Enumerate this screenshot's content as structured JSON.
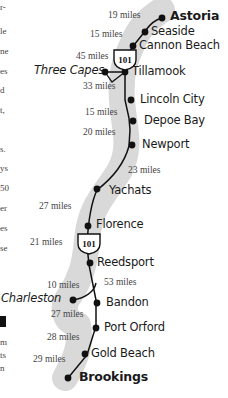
{
  "left_column_fragments": [
    "r-",
    "le",
    "ne",
    "es",
    "d",
    "t,",
    "",
    "s.",
    "ys",
    "50",
    "er",
    "es",
    "se",
    "",
    "",
    "m",
    "ts",
    "n"
  ],
  "route": {
    "highway": "101",
    "colors": {
      "corridor": "#d9d9d9",
      "line": "#111111",
      "dot": "#111111"
    },
    "stops": [
      {
        "name": "Astoria",
        "style": "bold"
      },
      {
        "name": "Seaside",
        "style": "normal"
      },
      {
        "name": "Cannon Beach",
        "style": "normal"
      },
      {
        "name": "Three Capes",
        "style": "italic"
      },
      {
        "name": "Tillamook",
        "style": "normal"
      },
      {
        "name": "Lincoln City",
        "style": "normal"
      },
      {
        "name": "Depoe Bay",
        "style": "normal"
      },
      {
        "name": "Newport",
        "style": "normal"
      },
      {
        "name": "Yachats",
        "style": "normal"
      },
      {
        "name": "Florence",
        "style": "normal"
      },
      {
        "name": "Reedsport",
        "style": "normal"
      },
      {
        "name": "Charleston",
        "style": "italic"
      },
      {
        "name": "Bandon",
        "style": "normal"
      },
      {
        "name": "Port Orford",
        "style": "normal"
      },
      {
        "name": "Gold Beach",
        "style": "normal"
      },
      {
        "name": "Brookings",
        "style": "bold"
      }
    ],
    "distances": [
      "19 miles",
      "15 miles",
      "45 miles",
      "33 miles",
      "15 miles",
      "20 miles",
      "23 miles",
      "27 miles",
      "21 miles",
      "10 miles",
      "53 miles",
      "27 miles",
      "28 miles",
      "29 miles"
    ]
  }
}
